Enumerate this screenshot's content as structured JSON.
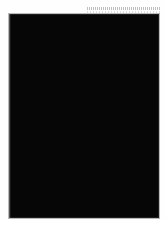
{
  "figure": {
    "kind": "molecular-structure-image",
    "rendering": "grayscale shaded spheres",
    "background_color": "#050505",
    "frame_color": "#b9b9b9",
    "page_color": "#ffffff",
    "caption": "",
    "title": "",
    "label": ""
  },
  "artifact": {
    "name": "dotted-scan-line",
    "description": "faint dotted horizontal rule at top right of the scanned page",
    "color": "#787878"
  },
  "molecule": {
    "palette": {
      "highlight": "#f2f2f2",
      "light": "#d8d8d8",
      "mid": "#9a9a9a",
      "shade": "#5e5e5e",
      "dark": "#2d2d2d",
      "void": "#060606"
    },
    "lobes": [
      {
        "name": "upper-cap",
        "cx": 0.5,
        "cy": 0.09,
        "rx": 0.17,
        "ry": 0.08
      },
      {
        "name": "left-domain",
        "cx": 0.33,
        "cy": 0.46,
        "rx": 0.25,
        "ry": 0.4
      },
      {
        "name": "right-domain",
        "cx": 0.66,
        "cy": 0.5,
        "rx": 0.27,
        "ry": 0.41
      },
      {
        "name": "lower-mass",
        "cx": 0.52,
        "cy": 0.83,
        "rx": 0.3,
        "ry": 0.17
      }
    ],
    "atom_count_rendered": 1500
  }
}
